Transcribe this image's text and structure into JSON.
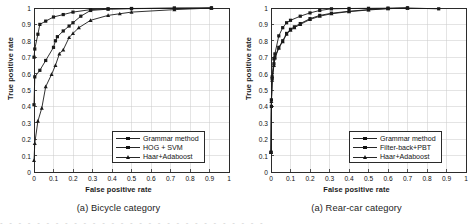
{
  "figure": {
    "panels": [
      {
        "id": "bicycle",
        "caption": "(a) Bicycle category",
        "xlabel": "False positive rate",
        "ylabel": "True positive rate",
        "legend": [
          {
            "label": "Grammar method",
            "marker": "square"
          },
          {
            "label": "HOG + SVM",
            "marker": "square"
          },
          {
            "label": "Haar+Adaboost",
            "marker": "triangle"
          }
        ]
      },
      {
        "id": "rear-car",
        "caption": "(a) Rear-car category",
        "xlabel": "False positive rate",
        "ylabel": "True positive rate",
        "legend": [
          {
            "label": "Grammar method",
            "marker": "square"
          },
          {
            "label": "Filter-back+PBT",
            "marker": "square"
          },
          {
            "label": "Haar+Adaboost",
            "marker": "triangle"
          }
        ]
      }
    ]
  },
  "page_bleed_text": "- - - - - - - - - - - - - - - - - - - - - - - - - - - - -",
  "chart_data": [
    {
      "type": "line",
      "id": "bicycle",
      "title": "(a) Bicycle category",
      "xlabel": "False positive rate",
      "ylabel": "True positive rate",
      "xlim": [
        0,
        1
      ],
      "ylim": [
        0,
        1
      ],
      "xticks": [
        "0",
        "0.1",
        "0.2",
        "0.3",
        "0.4",
        "0.5",
        "0.6",
        "0.7",
        "0.8",
        "0.9",
        "1"
      ],
      "yticks": [
        "0",
        "0.1",
        "0.2",
        "0.3",
        "0.4",
        "0.5",
        "0.6",
        "0.7",
        "0.8",
        "0.9",
        "1"
      ],
      "grid": true,
      "legend_position": "lower right",
      "series": [
        {
          "name": "Grammar method",
          "marker": "square",
          "color": "#1a1a1a",
          "points": [
            [
              0.0,
              0.7
            ],
            [
              0.004,
              0.75
            ],
            [
              0.02,
              0.84
            ],
            [
              0.03,
              0.9
            ],
            [
              0.06,
              0.92
            ],
            [
              0.1,
              0.945
            ],
            [
              0.15,
              0.96
            ],
            [
              0.2,
              0.975
            ],
            [
              0.29,
              0.99
            ],
            [
              0.38,
              0.995
            ],
            [
              0.5,
              0.997
            ],
            [
              0.72,
              0.999
            ],
            [
              0.91,
              1.0
            ]
          ]
        },
        {
          "name": "HOG + SVM",
          "marker": "square",
          "color": "#1a1a1a",
          "points": [
            [
              0.0,
              0.41
            ],
            [
              0.004,
              0.58
            ],
            [
              0.03,
              0.62
            ],
            [
              0.06,
              0.68
            ],
            [
              0.1,
              0.76
            ],
            [
              0.11,
              0.8
            ],
            [
              0.12,
              0.825
            ],
            [
              0.15,
              0.86
            ],
            [
              0.18,
              0.89
            ],
            [
              0.2,
              0.91
            ],
            [
              0.24,
              0.95
            ],
            [
              0.29,
              0.985
            ],
            [
              0.38,
              0.993
            ],
            [
              0.5,
              0.996
            ],
            [
              0.72,
              0.999
            ],
            [
              0.91,
              1.0
            ]
          ]
        },
        {
          "name": "Haar+Adaboost",
          "marker": "triangle",
          "color": "#1a1a1a",
          "points": [
            [
              0.0,
              0.07
            ],
            [
              0.004,
              0.175
            ],
            [
              0.02,
              0.31
            ],
            [
              0.04,
              0.39
            ],
            [
              0.06,
              0.52
            ],
            [
              0.09,
              0.595
            ],
            [
              0.11,
              0.65
            ],
            [
              0.13,
              0.72
            ],
            [
              0.15,
              0.745
            ],
            [
              0.18,
              0.82
            ],
            [
              0.2,
              0.845
            ],
            [
              0.23,
              0.88
            ],
            [
              0.29,
              0.925
            ],
            [
              0.38,
              0.955
            ],
            [
              0.44,
              0.965
            ],
            [
              0.5,
              0.975
            ],
            [
              0.72,
              0.99
            ],
            [
              0.91,
              1.0
            ]
          ]
        }
      ]
    },
    {
      "type": "line",
      "id": "rear-car",
      "title": "(a) Rear-car category",
      "xlabel": "False positive rate",
      "ylabel": "True positive rate",
      "xlim": [
        0,
        1
      ],
      "ylim": [
        0,
        1
      ],
      "xticks": [
        "0",
        "0.1",
        "0.2",
        "0.3",
        "0.4",
        "0.5",
        "0.6",
        "0.7",
        "0.8",
        "0.9",
        "1"
      ],
      "yticks": [
        "0",
        "0.1",
        "0.2",
        "0.3",
        "0.4",
        "0.5",
        "0.6",
        "0.7",
        "0.8",
        "0.9",
        "1"
      ],
      "grid": true,
      "legend_position": "lower right",
      "series": [
        {
          "name": "Grammar method",
          "marker": "square",
          "color": "#1a1a1a",
          "points": [
            [
              0.0,
              0.12
            ],
            [
              0.002,
              0.4
            ],
            [
              0.006,
              0.58
            ],
            [
              0.015,
              0.69
            ],
            [
              0.02,
              0.72
            ],
            [
              0.04,
              0.83
            ],
            [
              0.06,
              0.88
            ],
            [
              0.08,
              0.91
            ],
            [
              0.1,
              0.925
            ],
            [
              0.15,
              0.95
            ],
            [
              0.2,
              0.97
            ],
            [
              0.25,
              0.985
            ],
            [
              0.31,
              0.995
            ],
            [
              0.4,
              0.997
            ],
            [
              0.5,
              0.998
            ],
            [
              0.6,
              0.999
            ],
            [
              0.7,
              1.0
            ],
            [
              0.86,
              0.995
            ]
          ]
        },
        {
          "name": "Filter-back+PBT",
          "marker": "square",
          "color": "#1a1a1a",
          "points": [
            [
              0.0,
              0.12
            ],
            [
              0.002,
              0.44
            ],
            [
              0.006,
              0.57
            ],
            [
              0.015,
              0.66
            ],
            [
              0.02,
              0.7
            ],
            [
              0.04,
              0.76
            ],
            [
              0.06,
              0.8
            ],
            [
              0.08,
              0.845
            ],
            [
              0.1,
              0.87
            ],
            [
              0.12,
              0.885
            ],
            [
              0.15,
              0.905
            ],
            [
              0.2,
              0.935
            ],
            [
              0.25,
              0.955
            ],
            [
              0.31,
              0.968
            ],
            [
              0.4,
              0.98
            ],
            [
              0.5,
              0.99
            ],
            [
              0.6,
              0.997
            ],
            [
              0.7,
              1.0
            ]
          ]
        },
        {
          "name": "Haar+Adaboost",
          "marker": "triangle",
          "color": "#1a1a1a",
          "points": [
            [
              0.0,
              0.12
            ],
            [
              0.002,
              0.43
            ],
            [
              0.006,
              0.56
            ],
            [
              0.015,
              0.65
            ],
            [
              0.02,
              0.695
            ],
            [
              0.04,
              0.755
            ],
            [
              0.06,
              0.795
            ],
            [
              0.08,
              0.84
            ],
            [
              0.1,
              0.865
            ],
            [
              0.12,
              0.88
            ],
            [
              0.15,
              0.9
            ],
            [
              0.2,
              0.93
            ],
            [
              0.25,
              0.95
            ],
            [
              0.31,
              0.965
            ],
            [
              0.4,
              0.978
            ],
            [
              0.5,
              0.988
            ],
            [
              0.6,
              0.996
            ],
            [
              0.7,
              1.0
            ]
          ]
        }
      ]
    }
  ]
}
